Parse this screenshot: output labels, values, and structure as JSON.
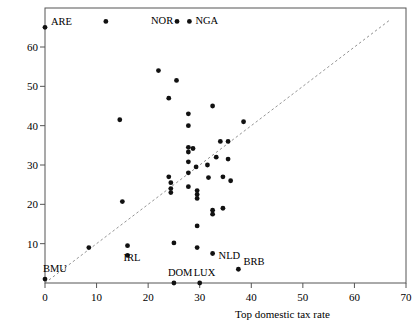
{
  "chart_data": {
    "type": "scatter",
    "title": "",
    "xlabel": "Top domestic tax rate",
    "ylabel": "",
    "xlim": [
      0,
      70
    ],
    "ylim": [
      0,
      67
    ],
    "xticks": [
      0,
      10,
      20,
      30,
      40,
      50,
      60,
      70
    ],
    "xticklabels": [
      "0",
      "10",
      "20",
      "30",
      "40",
      "50",
      "60",
      "70"
    ],
    "yticks": [
      10,
      20,
      30,
      40,
      50,
      60
    ],
    "yticklabels": [
      "10",
      "20",
      "30",
      "40",
      "50",
      "60"
    ],
    "grid": false,
    "legend": null,
    "reference_line": {
      "style": "dashed",
      "description": "45-degree identity line",
      "from": [
        0,
        0
      ],
      "to": [
        67,
        67
      ]
    },
    "points": [
      {
        "x": 0.0,
        "y": 65.0,
        "label": "ARE"
      },
      {
        "x": 0.0,
        "y": 1.0,
        "label": "BMU"
      },
      {
        "x": 8.5,
        "y": 9.0,
        "label": null
      },
      {
        "x": 11.8,
        "y": 66.5,
        "label": null
      },
      {
        "x": 14.5,
        "y": 41.5,
        "label": null
      },
      {
        "x": 15.0,
        "y": 20.7,
        "label": null
      },
      {
        "x": 16.0,
        "y": 9.5,
        "label": "IRL"
      },
      {
        "x": 16.0,
        "y": 7.0,
        "label": null
      },
      {
        "x": 22.0,
        "y": 54.0,
        "label": null
      },
      {
        "x": 24.0,
        "y": 47.0,
        "label": null
      },
      {
        "x": 24.0,
        "y": 27.0,
        "label": null
      },
      {
        "x": 24.4,
        "y": 25.5,
        "label": null
      },
      {
        "x": 24.4,
        "y": 24.0,
        "label": null
      },
      {
        "x": 24.4,
        "y": 23.0,
        "label": null
      },
      {
        "x": 25.0,
        "y": 10.2,
        "label": null
      },
      {
        "x": 25.0,
        "y": 0.0,
        "label": "DOM"
      },
      {
        "x": 25.5,
        "y": 51.5,
        "label": null
      },
      {
        "x": 25.6,
        "y": 66.5,
        "label": "NOR"
      },
      {
        "x": 28.0,
        "y": 66.5,
        "label": "NGA"
      },
      {
        "x": 27.8,
        "y": 43.0,
        "label": null
      },
      {
        "x": 27.8,
        "y": 40.0,
        "label": null
      },
      {
        "x": 27.8,
        "y": 34.5,
        "label": null
      },
      {
        "x": 28.7,
        "y": 34.2,
        "label": null
      },
      {
        "x": 27.8,
        "y": 33.3,
        "label": null
      },
      {
        "x": 27.8,
        "y": 30.8,
        "label": null
      },
      {
        "x": 27.8,
        "y": 28.0,
        "label": null
      },
      {
        "x": 27.8,
        "y": 24.5,
        "label": null
      },
      {
        "x": 29.3,
        "y": 29.5,
        "label": null
      },
      {
        "x": 29.5,
        "y": 23.5,
        "label": null
      },
      {
        "x": 29.5,
        "y": 22.5,
        "label": null
      },
      {
        "x": 29.5,
        "y": 21.5,
        "label": null
      },
      {
        "x": 29.5,
        "y": 14.5,
        "label": null
      },
      {
        "x": 29.5,
        "y": 9.0,
        "label": null
      },
      {
        "x": 30.0,
        "y": 0.0,
        "label": "LUX"
      },
      {
        "x": 31.5,
        "y": 30.0,
        "label": null
      },
      {
        "x": 31.7,
        "y": 26.8,
        "label": null
      },
      {
        "x": 32.5,
        "y": 45.0,
        "label": null
      },
      {
        "x": 32.5,
        "y": 18.5,
        "label": null
      },
      {
        "x": 32.5,
        "y": 17.5,
        "label": null
      },
      {
        "x": 32.5,
        "y": 7.5,
        "label": "NLD"
      },
      {
        "x": 33.2,
        "y": 32.0,
        "label": null
      },
      {
        "x": 34.0,
        "y": 36.0,
        "label": null
      },
      {
        "x": 34.5,
        "y": 27.0,
        "label": null
      },
      {
        "x": 34.5,
        "y": 19.0,
        "label": null
      },
      {
        "x": 35.5,
        "y": 36.0,
        "label": null
      },
      {
        "x": 35.5,
        "y": 31.5,
        "label": null
      },
      {
        "x": 36.0,
        "y": 26.0,
        "label": null
      },
      {
        "x": 37.5,
        "y": 3.5,
        "label": "BRB"
      },
      {
        "x": 38.5,
        "y": 41.0,
        "label": null
      }
    ]
  },
  "axes": {
    "x_title": "Top domestic tax rate"
  }
}
